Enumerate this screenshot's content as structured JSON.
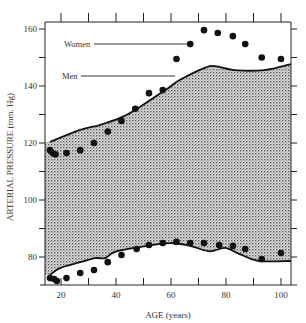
{
  "chart_data": {
    "type": "scatter",
    "title": "",
    "xlabel": "AGE (years)",
    "ylabel": "ARTERIAL PRESSURE (mm. Hg)",
    "xlim": [
      6,
      103
    ],
    "ylim": [
      70,
      162
    ],
    "x_ticks": [
      20,
      40,
      60,
      80,
      100
    ],
    "x_minor_ticks": [
      30,
      50,
      70,
      90
    ],
    "y_ticks": [
      80,
      100,
      120,
      140,
      160
    ],
    "y_minor_ticks": [
      90,
      110,
      130,
      150
    ],
    "grid": false,
    "annotations": [
      {
        "text": "Women",
        "points_to": "upper-dots"
      },
      {
        "text": "Men",
        "points_to": "upper-envelope"
      }
    ],
    "series": [
      {
        "name": "Systolic (dots)",
        "kind": "scatter",
        "points": [
          [
            16,
            117.5
          ],
          [
            17,
            116.5
          ],
          [
            18,
            116
          ],
          [
            22,
            116.5
          ],
          [
            27,
            117.5
          ],
          [
            32,
            120
          ],
          [
            37,
            124
          ],
          [
            42,
            127.7
          ],
          [
            47,
            132
          ],
          [
            52,
            137.5
          ],
          [
            57,
            138.6
          ],
          [
            62,
            149.5
          ],
          [
            67,
            154.7
          ],
          [
            72,
            159.6
          ],
          [
            77,
            158.6
          ],
          [
            82.5,
            157.5
          ],
          [
            87,
            154.7
          ],
          [
            93,
            150
          ],
          [
            100,
            149.5
          ]
        ]
      },
      {
        "name": "Diastolic (dots)",
        "kind": "scatter",
        "points": [
          [
            16,
            72.6
          ],
          [
            17.5,
            72.3
          ],
          [
            18.5,
            71.6
          ],
          [
            22,
            72.6
          ],
          [
            27,
            74.4
          ],
          [
            32,
            75.4
          ],
          [
            37,
            78.2
          ],
          [
            42,
            80.7
          ],
          [
            47.5,
            82.8
          ],
          [
            52,
            84.2
          ],
          [
            57,
            84.9
          ],
          [
            62,
            85.3
          ],
          [
            67,
            84.9
          ],
          [
            72,
            84.9
          ],
          [
            77.5,
            84.2
          ],
          [
            82.5,
            83.9
          ],
          [
            87,
            82.8
          ],
          [
            93,
            79.3
          ],
          [
            100,
            81.4
          ]
        ]
      },
      {
        "name": "Men systolic (curve)",
        "kind": "line",
        "points": [
          [
            16,
            120.4
          ],
          [
            27,
            124.6
          ],
          [
            34,
            126.3
          ],
          [
            41.5,
            128.8
          ],
          [
            47,
            131.6
          ],
          [
            58,
            138.6
          ],
          [
            63,
            142
          ],
          [
            72,
            146.3
          ],
          [
            76,
            147
          ],
          [
            83,
            145.6
          ],
          [
            94,
            145.6
          ],
          [
            103.6,
            147.7
          ]
        ]
      },
      {
        "name": "Men diastolic (curve)",
        "kind": "line",
        "points": [
          [
            16,
            73.7
          ],
          [
            19.6,
            76.1
          ],
          [
            27,
            78.2
          ],
          [
            32.4,
            79.6
          ],
          [
            36,
            79.6
          ],
          [
            39.6,
            81.8
          ],
          [
            48.7,
            83.5
          ],
          [
            59.6,
            84.9
          ],
          [
            67,
            83.9
          ],
          [
            74,
            82
          ],
          [
            79.6,
            83.2
          ],
          [
            85,
            81
          ],
          [
            92,
            78.6
          ],
          [
            103.6,
            78.6
          ]
        ]
      }
    ],
    "colors": {
      "ink": "#111111",
      "fill_pattern_dot": "#555555",
      "fill_background": "#d8d8d8"
    }
  }
}
